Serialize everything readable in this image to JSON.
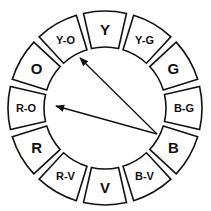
{
  "diagram": {
    "center": [
      105,
      108
    ],
    "outer_radius": 97,
    "inner_radius": 61,
    "gap_degrees": 2.2,
    "segments": [
      {
        "label": "Y",
        "angle": -90,
        "size": 15
      },
      {
        "label": "Y-G",
        "angle": -60,
        "size": 11
      },
      {
        "label": "G",
        "angle": -30,
        "size": 15
      },
      {
        "label": "B-G",
        "angle": 0,
        "size": 11
      },
      {
        "label": "B",
        "angle": 30,
        "size": 15
      },
      {
        "label": "B-V",
        "angle": 60,
        "size": 11
      },
      {
        "label": "V",
        "angle": 90,
        "size": 15
      },
      {
        "label": "R-V",
        "angle": 120,
        "size": 11
      },
      {
        "label": "R",
        "angle": 150,
        "size": 15
      },
      {
        "label": "R-O",
        "angle": 180,
        "size": 11
      },
      {
        "label": "O",
        "angle": 210,
        "size": 15
      },
      {
        "label": "Y-O",
        "angle": 240,
        "size": 11
      }
    ],
    "arrows": [
      {
        "from": "B",
        "to": "Y-O",
        "start": [
          157,
          134
        ],
        "end": [
          80,
          58
        ]
      },
      {
        "from": "B",
        "to": "R-O",
        "start": [
          157,
          134
        ],
        "end": [
          56,
          106
        ]
      }
    ],
    "colors": {
      "stroke": "#111111",
      "fill": "#ffffff"
    }
  }
}
